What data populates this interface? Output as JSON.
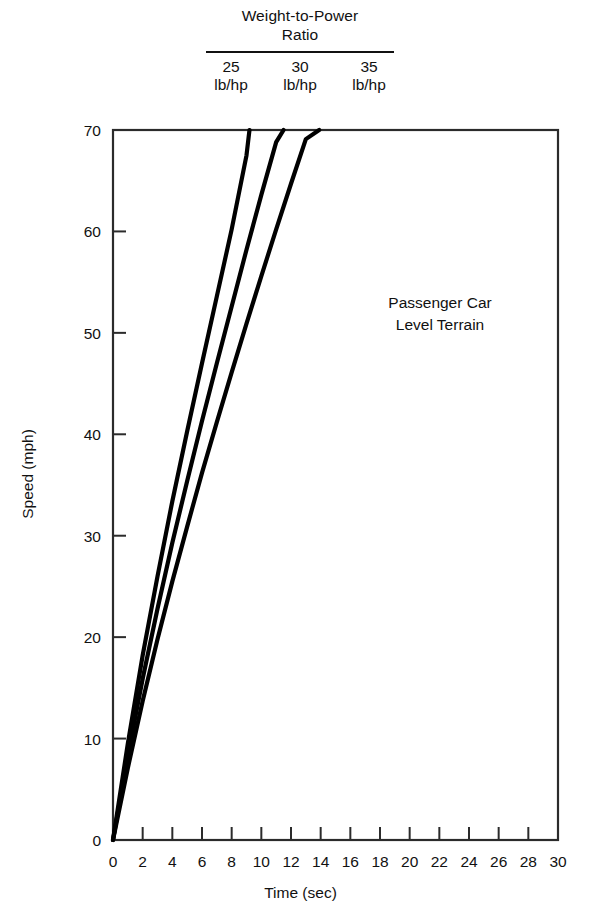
{
  "legend": {
    "title_line1": "Weight-to-Power",
    "title_line2": "Ratio",
    "columns": [
      {
        "value": "25",
        "unit": "lb/hp"
      },
      {
        "value": "30",
        "unit": "lb/hp"
      },
      {
        "value": "35",
        "unit": "lb/hp"
      }
    ]
  },
  "annotation": {
    "line1": "Passenger Car",
    "line2": "Level Terrain"
  },
  "chart_data": {
    "type": "line",
    "title": "Weight-to-Power Ratio",
    "xlabel": "Time (sec)",
    "ylabel": "Speed (mph)",
    "xlim": [
      0,
      30
    ],
    "ylim": [
      0,
      70
    ],
    "xticks": [
      0,
      2,
      4,
      6,
      8,
      10,
      12,
      14,
      16,
      18,
      20,
      22,
      24,
      26,
      28,
      30
    ],
    "yticks": [
      0,
      10,
      20,
      30,
      40,
      50,
      60,
      70
    ],
    "grid": false,
    "legend_position": "above-plot",
    "annotations": [
      "Passenger Car",
      "Level Terrain"
    ],
    "series": [
      {
        "name": "25 lb/hp",
        "x": [
          0,
          1,
          2,
          3,
          4,
          5,
          6,
          7,
          8,
          9,
          9.2
        ],
        "y": [
          0,
          9.5,
          18.2,
          26.0,
          33.4,
          40.3,
          47.0,
          53.6,
          60.2,
          67.5,
          70.0
        ]
      },
      {
        "name": "30 lb/hp",
        "x": [
          0,
          1,
          2,
          3,
          4,
          5,
          6,
          7,
          8,
          9,
          10,
          11,
          11.5
        ],
        "y": [
          0,
          8.3,
          15.9,
          22.8,
          29.3,
          35.4,
          41.3,
          47.0,
          52.6,
          58.2,
          63.6,
          68.8,
          70.0
        ]
      },
      {
        "name": "35 lb/hp",
        "x": [
          0,
          1,
          2,
          3,
          4,
          5,
          6,
          7,
          8,
          9,
          10,
          11,
          12,
          13,
          13.9
        ],
        "y": [
          0,
          7.1,
          13.7,
          19.8,
          25.5,
          30.9,
          36.2,
          41.2,
          46.1,
          50.9,
          55.6,
          60.2,
          64.7,
          69.1,
          70.0
        ]
      }
    ]
  }
}
